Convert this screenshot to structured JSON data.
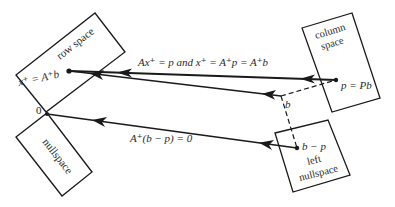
{
  "diagram": {
    "regions": {
      "row_space": {
        "label": "row space"
      },
      "nullspace": {
        "label": "nullspace"
      },
      "column_space": {
        "label_line1": "column",
        "label_line2": "space"
      },
      "left_nullspace": {
        "label_line1": "left",
        "label_line2": "nullspace"
      }
    },
    "points": {
      "x_plus": "x⁺ = A⁺b",
      "origin": "0",
      "p": "p = Pb",
      "b": "b",
      "b_minus_p": "b − p"
    },
    "arrows": {
      "top": "Ax⁺ = p  and  x⁺ = A⁺p = A⁺b",
      "bottom": "A⁺(b − p) = 0"
    },
    "colors": {
      "ink": "#1a1a1a",
      "background": "#ffffff"
    }
  }
}
